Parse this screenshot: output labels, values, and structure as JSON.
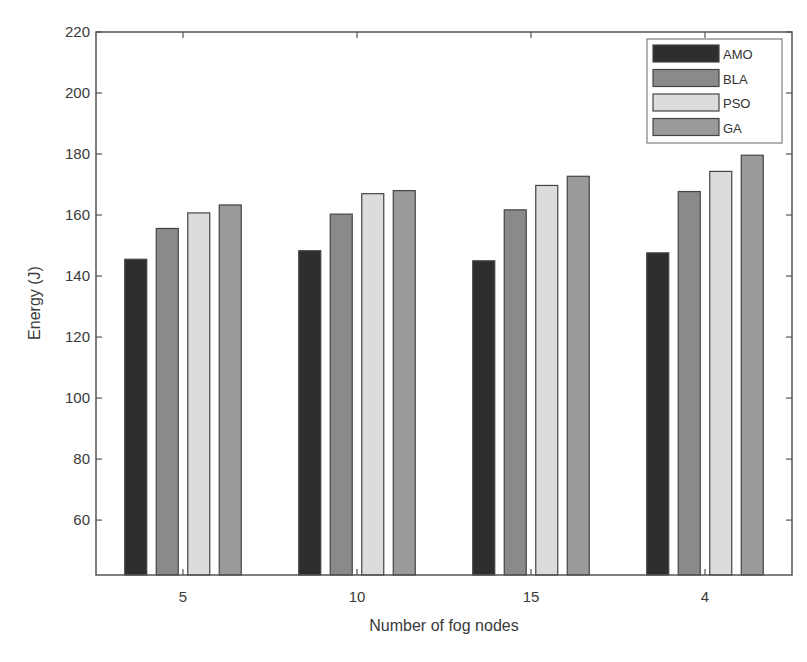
{
  "chart_data": {
    "type": "bar",
    "title": "",
    "xlabel": "Number of fog nodes",
    "ylabel": "Energy (J)",
    "categories": [
      "5",
      "10",
      "15",
      "4"
    ],
    "series": [
      {
        "name": "AMO",
        "color": "#2e2e2e",
        "values": [
          145.5,
          148.3,
          145.0,
          147.6
        ]
      },
      {
        "name": "BLA",
        "color": "#8a8a8a",
        "values": [
          155.6,
          160.3,
          161.7,
          167.7
        ]
      },
      {
        "name": "PSO",
        "color": "#dcdcdc",
        "values": [
          160.7,
          167.0,
          169.7,
          174.3
        ]
      },
      {
        "name": "GA",
        "color": "#9a9a9a",
        "values": [
          163.3,
          168.0,
          172.7,
          179.6
        ]
      }
    ],
    "ylim": [
      42,
      220
    ],
    "yticks": [
      60,
      80,
      100,
      120,
      140,
      160,
      180,
      200,
      220
    ],
    "grid": false,
    "legend_position": "upper right"
  }
}
